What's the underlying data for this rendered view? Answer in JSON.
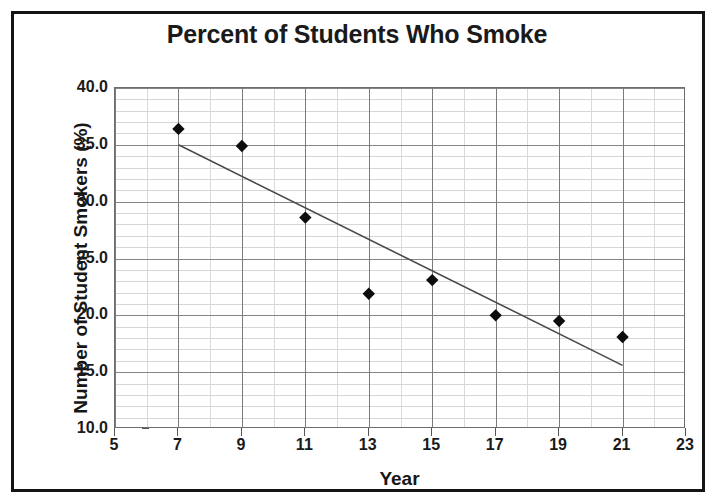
{
  "figure": {
    "title": "Percent of Students Who Smoke",
    "border_color": "#141414",
    "background": "#ffffff"
  },
  "chart_data": {
    "type": "scatter",
    "title": "Percent of Students Who Smoke",
    "xlabel": "Year",
    "ylabel": "Number of Student Smokers (%)",
    "xlim": [
      5,
      23
    ],
    "ylim": [
      10.0,
      40.0
    ],
    "grid": true,
    "legend": "none",
    "marker": "diamond",
    "marker_color": "#0d0d0d",
    "trendline_color": "#4a4a4a",
    "x_ticks": [
      5,
      7,
      9,
      11,
      13,
      15,
      17,
      19,
      21,
      23
    ],
    "x_tick_labels": [
      "5",
      "7",
      "9",
      "11",
      "13",
      "15",
      "17",
      "19",
      "21",
      "23"
    ],
    "y_ticks": [
      10.0,
      15.0,
      20.0,
      25.0,
      30.0,
      35.0,
      40.0
    ],
    "y_tick_labels": [
      "10.0",
      "15.0",
      "20.0",
      "25.0",
      "30.0",
      "35.0",
      "40.0"
    ],
    "x_minor_step": 1,
    "y_minor_step": 1.0,
    "x": [
      7,
      9,
      11,
      13,
      15,
      17,
      19,
      21
    ],
    "values": [
      36.4,
      34.9,
      28.6,
      21.9,
      23.1,
      20.0,
      19.5,
      18.1
    ],
    "series": [
      {
        "name": "Student smokers",
        "x": [
          7,
          9,
          11,
          13,
          15,
          17,
          19,
          21
        ],
        "values": [
          36.4,
          34.9,
          28.6,
          21.9,
          23.1,
          20.0,
          19.5,
          18.1
        ]
      }
    ],
    "trendline": {
      "type": "linear",
      "x_start": 7,
      "y_start": 35.0,
      "x_end": 21,
      "y_end": 15.6
    }
  }
}
